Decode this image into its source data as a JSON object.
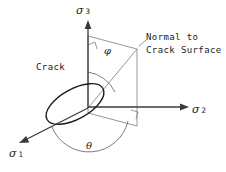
{
  "figure": {
    "type": "3d-crack-orientation-diagram",
    "background_color": "#ffffff",
    "stroke_color": "#2b2b2b",
    "labels": {
      "sigma3": {
        "symbol": "σ",
        "subscript": "3",
        "x": 78,
        "y": 3
      },
      "sigma2": {
        "symbol": "σ",
        "subscript": "2",
        "x": 192,
        "y": 104
      },
      "sigma1": {
        "symbol": "σ",
        "subscript": "1",
        "x": 10,
        "y": 147
      },
      "phi": {
        "text": "φ",
        "x": 104,
        "y": 50
      },
      "theta": {
        "text": "θ",
        "x": 87,
        "y": 142
      },
      "crack": {
        "text": "Crack",
        "x": 38,
        "y": 64
      },
      "normal_line1": {
        "text": "Normal to",
        "x": 148,
        "y": 36
      },
      "normal_line2": {
        "text": "Crack Surface",
        "x": 148,
        "y": 49
      }
    },
    "geometry": {
      "origin": {
        "x": 88,
        "y": 108
      },
      "sigma3_tip": {
        "x": 88,
        "y": 22
      },
      "sigma2_tip": {
        "x": 188,
        "y": 107
      },
      "sigma1_tip": {
        "x": 20,
        "y": 142
      },
      "plane_points": "88,36 137,49 137,126 88,113",
      "normal_end": {
        "x": 137,
        "y": 49
      },
      "crack_ellipse": {
        "cx": 74,
        "cy": 105,
        "rx": 31,
        "ry": 15,
        "rotation": -28
      },
      "phi_arc": "M 88,74 A 34,34 0 0 1 116,91",
      "theta_arc": "M 56,126 A 38,38 0 0 0 126,120",
      "right_angle_top": "94,40 94,47 88,45",
      "right_angle_bottom": "137,112 137,120 130,117"
    }
  }
}
